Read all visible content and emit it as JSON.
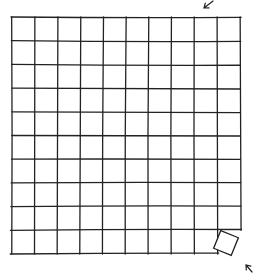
{
  "sketch": {
    "description": "Hand-drawn 10x10 grid with one bottom-right tile rotated out",
    "grid": {
      "cols": 10,
      "rows": 10,
      "left": 11,
      "top": 17,
      "right": 241,
      "bottom": 254
    },
    "missing_cell": {
      "col": 9,
      "row": 9
    },
    "rotated_tile": {
      "cx": 226,
      "cy": 243,
      "size": 19,
      "angle": 22
    },
    "arrows": [
      {
        "name": "top-right-arrow",
        "x1": 213,
        "y1": 1,
        "x2": 204,
        "y2": 8
      },
      {
        "name": "bottom-right-arrow",
        "x1": 252,
        "y1": 272,
        "x2": 246,
        "y2": 265
      }
    ],
    "stroke_color": "#222222"
  }
}
